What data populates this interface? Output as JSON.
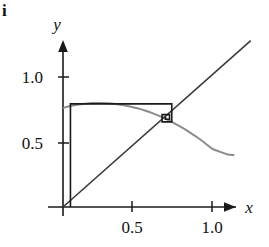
{
  "figure": {
    "label": "i",
    "caption": ""
  },
  "axes": {
    "x_name": "x",
    "y_name": "y",
    "x_ticks": [
      {
        "value": 0.5,
        "label": "0.5"
      },
      {
        "value": 1.0,
        "label": "1.0"
      }
    ],
    "y_ticks": [
      {
        "value": 0.5,
        "label": "0.5"
      },
      {
        "value": 1.0,
        "label": "1.0"
      }
    ],
    "x_range": [
      -0.05,
      1.25
    ],
    "y_range": [
      -0.12,
      1.25
    ],
    "axis_color": "#1a1a1a"
  },
  "chart_data": {
    "type": "line",
    "title": "",
    "xlabel": "x",
    "ylabel": "y",
    "xlim": [
      -0.05,
      1.25
    ],
    "ylim": [
      -0.12,
      1.25
    ],
    "grid": false,
    "legend": "none",
    "series": [
      {
        "name": "map-curve",
        "kind": "curve",
        "color": "#8c8c8c",
        "width": 2.0,
        "points": [
          [
            0.0,
            0.75
          ],
          [
            0.05,
            0.765
          ],
          [
            0.1,
            0.776
          ],
          [
            0.15,
            0.783
          ],
          [
            0.2,
            0.787
          ],
          [
            0.25,
            0.788
          ],
          [
            0.3,
            0.786
          ],
          [
            0.35,
            0.781
          ],
          [
            0.4,
            0.773
          ],
          [
            0.45,
            0.762
          ],
          [
            0.5,
            0.748
          ],
          [
            0.55,
            0.731
          ],
          [
            0.6,
            0.711
          ],
          [
            0.65,
            0.688
          ],
          [
            0.7,
            0.662
          ],
          [
            0.73,
            0.645
          ],
          [
            0.8,
            0.601
          ],
          [
            0.85,
            0.566
          ],
          [
            0.9,
            0.528
          ],
          [
            0.95,
            0.487
          ],
          [
            1.0,
            0.443
          ],
          [
            1.05,
            0.42
          ],
          [
            1.1,
            0.4
          ],
          [
            1.15,
            0.392
          ]
        ]
      },
      {
        "name": "identity-line",
        "kind": "line",
        "color": "#3a3a3a",
        "width": 1.6,
        "points": [
          [
            0.0,
            0.0
          ],
          [
            1.26,
            1.26
          ]
        ]
      },
      {
        "name": "cobweb-path",
        "kind": "staircase",
        "color": "#1a1a1a",
        "width": 1.6,
        "points": [
          [
            0.05,
            0.0
          ],
          [
            0.05,
            0.781
          ],
          [
            0.73,
            0.781
          ],
          [
            0.73,
            0.645
          ],
          [
            0.665,
            0.645
          ],
          [
            0.665,
            0.7
          ],
          [
            0.715,
            0.7
          ],
          [
            0.715,
            0.665
          ],
          [
            0.688,
            0.665
          ],
          [
            0.688,
            0.684
          ]
        ]
      }
    ],
    "annotations": [
      {
        "name": "fixed-point",
        "x": 0.7,
        "y": 0.7,
        "note": "attracting fixed point of the map"
      }
    ]
  }
}
